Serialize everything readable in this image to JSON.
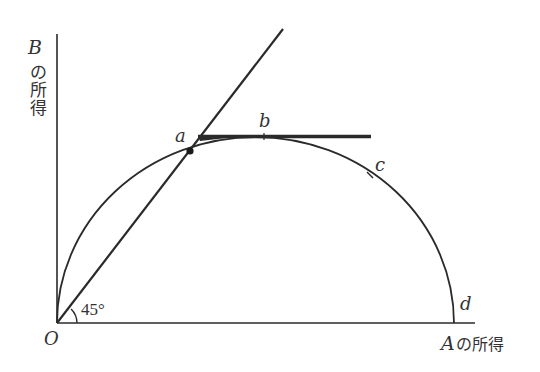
{
  "diagram": {
    "type": "utility-possibility-frontier",
    "axes": {
      "y_label_var": "B",
      "y_label_text": [
        "の",
        "所",
        "得"
      ],
      "x_label_var": "A",
      "x_label_text": "の所得",
      "origin_label": "O"
    },
    "angle_label": "45°",
    "points": [
      {
        "id": "a",
        "label": "a",
        "description": "intersection of 45° line and frontier (equal incomes)"
      },
      {
        "id": "b",
        "label": "b",
        "description": "maximum of frontier (tangent horizontal line)"
      },
      {
        "id": "c",
        "label": "c",
        "description": "point on frontier"
      },
      {
        "id": "d",
        "label": "d",
        "description": "frontier meets A-income axis"
      }
    ],
    "colors": {
      "line": "#2a2a2a",
      "text": "#333333"
    }
  }
}
